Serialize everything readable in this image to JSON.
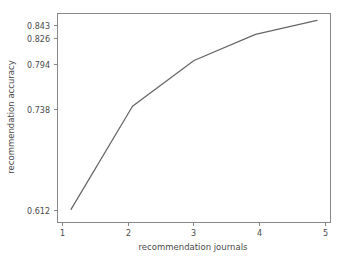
{
  "chart_data": {
    "type": "line",
    "title": "",
    "xlabel": "recommendation journals",
    "ylabel": "recommendation accuracy",
    "x": [
      1,
      2,
      3,
      4,
      5
    ],
    "values": [
      0.612,
      0.738,
      0.794,
      0.826,
      0.843
    ],
    "series": [
      {
        "name": "recommendation accuracy",
        "values": [
          0.612,
          0.738,
          0.794,
          0.826,
          0.843
        ]
      }
    ],
    "xticks": [
      "1",
      "2",
      "3",
      "4",
      "5"
    ],
    "yticks": [
      "0.612",
      "0.738",
      "0.794",
      "0.826",
      "0.843"
    ],
    "ytick_values": [
      0.612,
      0.738,
      0.794,
      0.826,
      0.843
    ],
    "xlim": [
      0.78,
      5.22
    ],
    "ylim": [
      0.5965,
      0.8515
    ],
    "grid": false,
    "legend": null,
    "line_color": "#666666",
    "axis_color": "#888888",
    "background_color": "#ffffff"
  }
}
